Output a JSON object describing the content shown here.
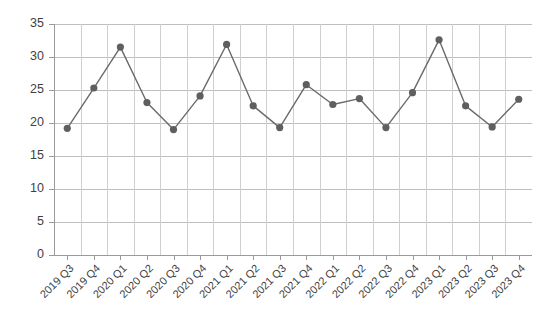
{
  "chart_data": {
    "type": "line",
    "title": "",
    "subtitle": "",
    "xlabel": "",
    "ylabel": "",
    "categories": [
      "2019 Q3",
      "2019 Q4",
      "2020 Q1",
      "2020 Q2",
      "2020 Q3",
      "2020 Q4",
      "2021 Q1",
      "2021 Q2",
      "2021 Q3",
      "2021 Q4",
      "2022 Q1",
      "2022 Q2",
      "2022 Q3",
      "2022 Q4",
      "2023 Q1",
      "2023 Q2",
      "2023 Q3",
      "2023 Q4"
    ],
    "values": [
      19.2,
      25.3,
      31.5,
      23.1,
      19.0,
      24.1,
      31.9,
      22.6,
      19.3,
      25.8,
      22.8,
      23.7,
      19.3,
      24.6,
      32.6,
      22.6,
      19.4,
      23.6
    ],
    "series": [
      {
        "name": "Series 1",
        "values": [
          19.2,
          25.3,
          31.5,
          23.1,
          19.0,
          24.1,
          31.9,
          22.6,
          19.3,
          25.8,
          22.8,
          23.7,
          19.3,
          24.6,
          32.6,
          22.6,
          19.4,
          23.6
        ],
        "color": "#6a6a6a",
        "marker": "circle"
      }
    ],
    "ylim": [
      0,
      35
    ],
    "yticks": [
      0,
      5,
      10,
      15,
      20,
      25,
      30,
      35
    ],
    "ytick_labels": [
      "0",
      "5",
      "10",
      "15",
      "20",
      "25",
      "30",
      "35"
    ],
    "grid": {
      "horizontal": true,
      "vertical": true
    },
    "legend": {
      "visible": false,
      "position": "none",
      "entries": []
    },
    "annotations": []
  },
  "colors": {
    "line": "#6a6a6a",
    "marker": "#5f5f5f",
    "grid_horizontal": "#bfbfbf",
    "grid_vertical": "#cfcfcf",
    "axis": "#9a9a9a",
    "text": "#3f3f3f",
    "background": "#ffffff"
  }
}
